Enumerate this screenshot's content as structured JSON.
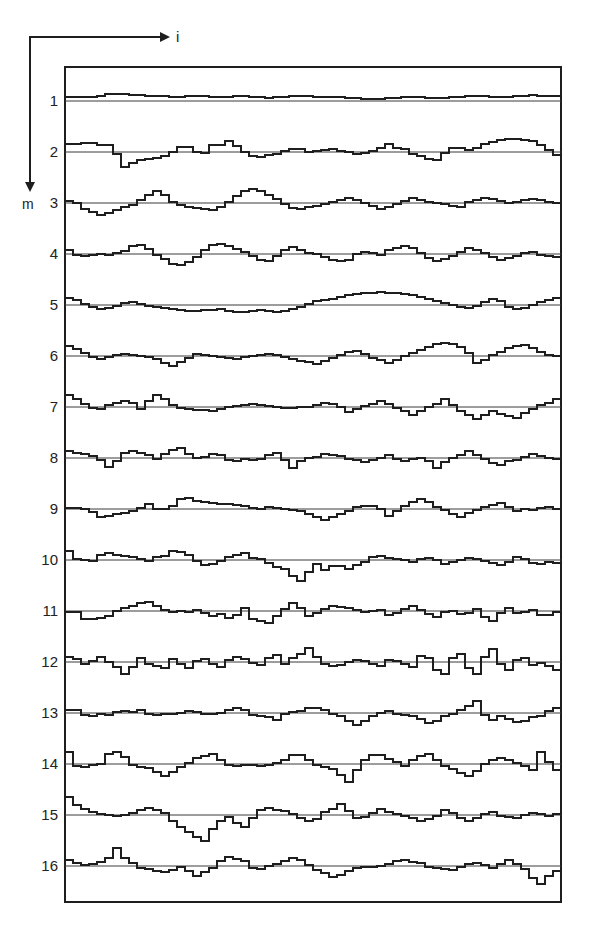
{
  "figure": {
    "x_axis_label": "i",
    "y_axis_label": "m",
    "frame": {
      "x": 65,
      "y": 67,
      "width": 496,
      "height": 835
    },
    "ink_color": "#1e1e1e",
    "baseline_color": "#3a3a3a"
  },
  "chart_data": {
    "type": "line",
    "title": "",
    "xlabel": "i",
    "ylabel": "m",
    "grid": false,
    "legend": "none",
    "step_count": 62,
    "row_labels": [
      "1",
      "2",
      "3",
      "4",
      "5",
      "6",
      "7",
      "8",
      "9",
      "10",
      "11",
      "12",
      "13",
      "14",
      "15",
      "16"
    ],
    "baselines_px": [
      101,
      152,
      203,
      254,
      305,
      356,
      407,
      458,
      509,
      560,
      611,
      662,
      713,
      764,
      815,
      866
    ],
    "series": [
      {
        "name": "1",
        "values": [
          4,
          4,
          4,
          4,
          5,
          7,
          7,
          7,
          6,
          6,
          5,
          5,
          5,
          4,
          4,
          5,
          5,
          5,
          4,
          4,
          4,
          5,
          5,
          4,
          4,
          3,
          4,
          4,
          5,
          5,
          5,
          4,
          4,
          4,
          4,
          3,
          3,
          2,
          2,
          2,
          3,
          3,
          4,
          4,
          4,
          3,
          3,
          3,
          4,
          4,
          5,
          5,
          5,
          4,
          4,
          4,
          5,
          5,
          6,
          5,
          5,
          5
        ]
      },
      {
        "name": "2",
        "values": [
          8,
          8,
          9,
          9,
          7,
          7,
          -2,
          -15,
          -11,
          -8,
          -7,
          -6,
          -4,
          0,
          5,
          5,
          0,
          -1,
          7,
          7,
          11,
          6,
          0,
          -4,
          -5,
          -3,
          -2,
          1,
          3,
          3,
          0,
          1,
          2,
          3,
          1,
          0,
          -2,
          -1,
          1,
          4,
          8,
          4,
          3,
          -2,
          -4,
          -7,
          -8,
          -1,
          4,
          4,
          2,
          4,
          8,
          10,
          12,
          13,
          13,
          12,
          11,
          7,
          2,
          -3
        ]
      },
      {
        "name": "3",
        "values": [
          2,
          0,
          -6,
          -9,
          -12,
          -10,
          -7,
          -4,
          -2,
          3,
          8,
          12,
          8,
          1,
          -2,
          -4,
          -5,
          -6,
          -7,
          -4,
          1,
          7,
          12,
          14,
          12,
          8,
          4,
          -1,
          -5,
          -6,
          -4,
          -3,
          -1,
          1,
          3,
          5,
          3,
          0,
          -3,
          -6,
          -4,
          -1,
          2,
          5,
          3,
          1,
          0,
          -1,
          -3,
          -4,
          1,
          3,
          5,
          4,
          2,
          0,
          1,
          3,
          4,
          3,
          1,
          0
        ]
      },
      {
        "name": "4",
        "values": [
          4,
          -1,
          -2,
          -1,
          0,
          -1,
          1,
          3,
          8,
          9,
          5,
          -1,
          -5,
          -10,
          -11,
          -8,
          -3,
          4,
          9,
          10,
          8,
          5,
          2,
          -2,
          -6,
          -7,
          -2,
          4,
          7,
          4,
          1,
          0,
          -3,
          -6,
          -7,
          -6,
          0,
          2,
          1,
          -1,
          4,
          6,
          8,
          6,
          1,
          -4,
          -7,
          -5,
          -2,
          2,
          6,
          4,
          1,
          -3,
          -6,
          -4,
          -2,
          1,
          2,
          -1,
          -2,
          -3
        ]
      },
      {
        "name": "5",
        "values": [
          7,
          5,
          1,
          -2,
          -4,
          -3,
          -1,
          2,
          3,
          1,
          -1,
          -2,
          -3,
          -4,
          -5,
          -6,
          -6,
          -5,
          -5,
          -4,
          -6,
          -7,
          -7,
          -6,
          -5,
          -6,
          -7,
          -6,
          -4,
          -2,
          1,
          4,
          5,
          6,
          8,
          10,
          11,
          12,
          12,
          13,
          12,
          12,
          11,
          10,
          8,
          6,
          4,
          2,
          0,
          -2,
          -3,
          -1,
          3,
          6,
          4,
          -2,
          -4,
          -3,
          0,
          3,
          5,
          7
        ]
      },
      {
        "name": "6",
        "values": [
          10,
          7,
          3,
          -1,
          -3,
          -1,
          1,
          2,
          1,
          0,
          -1,
          -3,
          -7,
          -10,
          -6,
          -2,
          2,
          1,
          0,
          -1,
          -2,
          -3,
          -1,
          0,
          1,
          2,
          1,
          -1,
          -3,
          -5,
          -6,
          -8,
          -5,
          -2,
          1,
          4,
          5,
          2,
          -2,
          -4,
          -7,
          -4,
          0,
          3,
          6,
          9,
          12,
          13,
          12,
          9,
          3,
          -7,
          -4,
          1,
          4,
          8,
          10,
          11,
          8,
          4,
          1,
          0
        ]
      },
      {
        "name": "7",
        "values": [
          12,
          8,
          3,
          -1,
          -2,
          2,
          4,
          6,
          4,
          -2,
          6,
          12,
          8,
          2,
          -1,
          -2,
          -3,
          -3,
          -4,
          -2,
          0,
          1,
          2,
          3,
          2,
          1,
          0,
          -1,
          -1,
          0,
          0,
          2,
          4,
          3,
          0,
          -5,
          -2,
          1,
          3,
          6,
          3,
          -1,
          -4,
          -8,
          -4,
          0,
          3,
          8,
          2,
          -4,
          -8,
          -12,
          -8,
          -4,
          -7,
          -9,
          -11,
          -6,
          -2,
          2,
          4,
          8
        ]
      },
      {
        "name": "8",
        "values": [
          7,
          5,
          4,
          2,
          -2,
          -9,
          -3,
          5,
          7,
          5,
          3,
          -1,
          4,
          8,
          10,
          4,
          0,
          1,
          4,
          3,
          -2,
          -3,
          -1,
          -2,
          -1,
          3,
          5,
          -2,
          -10,
          -3,
          0,
          1,
          4,
          3,
          2,
          -1,
          -2,
          -4,
          -2,
          0,
          3,
          -1,
          -3,
          -1,
          0,
          -3,
          -10,
          -4,
          0,
          3,
          7,
          3,
          -1,
          -5,
          -7,
          -3,
          -2,
          1,
          4,
          2,
          0,
          -1
        ]
      },
      {
        "name": "9",
        "values": [
          1,
          1,
          0,
          -3,
          -8,
          -7,
          -5,
          -4,
          -2,
          1,
          5,
          0,
          0,
          3,
          10,
          11,
          8,
          7,
          6,
          5,
          5,
          4,
          3,
          1,
          0,
          2,
          1,
          0,
          -1,
          -2,
          -5,
          -8,
          -11,
          -8,
          -5,
          -2,
          2,
          3,
          3,
          0,
          -7,
          -2,
          3,
          7,
          10,
          7,
          2,
          -1,
          -5,
          -8,
          -4,
          -1,
          2,
          4,
          6,
          2,
          -2,
          0,
          -1,
          1,
          2,
          0
        ]
      },
      {
        "name": "10",
        "values": [
          9,
          1,
          0,
          -1,
          5,
          7,
          5,
          4,
          3,
          1,
          -1,
          3,
          4,
          9,
          8,
          5,
          -1,
          -5,
          -4,
          -1,
          3,
          5,
          7,
          2,
          1,
          -3,
          -7,
          -9,
          -16,
          -21,
          -12,
          -4,
          -10,
          -6,
          -6,
          -9,
          -5,
          -2,
          3,
          4,
          2,
          1,
          0,
          -2,
          1,
          2,
          0,
          -4,
          -2,
          0,
          2,
          1,
          -1,
          -3,
          -5,
          -2,
          3,
          1,
          -3,
          -4,
          -2,
          -3
        ]
      },
      {
        "name": "11",
        "values": [
          -1,
          -1,
          -8,
          -8,
          -7,
          -5,
          0,
          3,
          5,
          8,
          9,
          5,
          1,
          -1,
          0,
          -1,
          1,
          -2,
          -5,
          -3,
          -7,
          -4,
          3,
          -8,
          -10,
          -12,
          -5,
          2,
          8,
          3,
          -5,
          -2,
          2,
          5,
          4,
          3,
          1,
          -1,
          0,
          1,
          -4,
          -2,
          2,
          5,
          1,
          -3,
          -6,
          -1,
          0,
          -3,
          -2,
          2,
          -6,
          -10,
          -2,
          3,
          -2,
          -1,
          1,
          -4,
          -4,
          -1
        ]
      },
      {
        "name": "12",
        "values": [
          5,
          3,
          -2,
          1,
          5,
          0,
          -5,
          -12,
          -5,
          4,
          -2,
          -4,
          -6,
          3,
          -2,
          -6,
          1,
          3,
          -2,
          -5,
          2,
          5,
          3,
          -1,
          -3,
          4,
          7,
          -2,
          4,
          8,
          14,
          5,
          -2,
          -4,
          -3,
          0,
          2,
          1,
          -2,
          -4,
          2,
          1,
          -2,
          -5,
          6,
          4,
          -8,
          -12,
          4,
          8,
          -6,
          -12,
          5,
          13,
          -2,
          -8,
          2,
          4,
          -3,
          -1,
          -4,
          -8
        ]
      },
      {
        "name": "13",
        "values": [
          3,
          3,
          -2,
          -3,
          -1,
          -2,
          1,
          2,
          1,
          3,
          -1,
          -2,
          -1,
          -1,
          0,
          2,
          1,
          -1,
          -1,
          0,
          3,
          5,
          3,
          -2,
          -3,
          -4,
          -7,
          -1,
          1,
          2,
          5,
          5,
          3,
          -1,
          -3,
          -8,
          -12,
          -8,
          -3,
          0,
          2,
          -1,
          -2,
          -3,
          -6,
          -10,
          -8,
          -3,
          -1,
          3,
          7,
          12,
          -2,
          -7,
          -3,
          -6,
          -9,
          -8,
          -4,
          -3,
          2,
          5
        ]
      },
      {
        "name": "14",
        "values": [
          12,
          -2,
          -3,
          -1,
          0,
          10,
          12,
          7,
          -1,
          -3,
          -4,
          -8,
          -12,
          -8,
          -3,
          1,
          6,
          8,
          10,
          4,
          -1,
          -2,
          -1,
          -1,
          -2,
          -1,
          1,
          4,
          9,
          9,
          4,
          -1,
          -3,
          -5,
          -11,
          -18,
          -6,
          4,
          9,
          9,
          5,
          2,
          -2,
          4,
          8,
          10,
          4,
          -2,
          -5,
          -9,
          -12,
          -7,
          0,
          4,
          6,
          4,
          1,
          -2,
          -6,
          12,
          2,
          -6
        ]
      },
      {
        "name": "15",
        "values": [
          18,
          10,
          6,
          3,
          1,
          0,
          -1,
          0,
          2,
          5,
          7,
          5,
          2,
          -6,
          -12,
          -17,
          -22,
          -26,
          -14,
          -6,
          -2,
          -8,
          -12,
          -3,
          5,
          7,
          5,
          4,
          1,
          -3,
          -6,
          -4,
          3,
          6,
          11,
          4,
          -3,
          -2,
          2,
          6,
          3,
          1,
          -1,
          -3,
          -6,
          -4,
          -1,
          5,
          2,
          -3,
          -6,
          -3,
          1,
          3,
          -1,
          -2,
          -3,
          0,
          2,
          1,
          -1,
          1
        ]
      },
      {
        "name": "16",
        "values": [
          6,
          3,
          1,
          2,
          4,
          8,
          18,
          8,
          3,
          -2,
          -3,
          -5,
          -6,
          -4,
          -1,
          -5,
          -10,
          -6,
          -2,
          5,
          9,
          7,
          5,
          -2,
          -3,
          0,
          2,
          5,
          8,
          6,
          1,
          -4,
          -7,
          -11,
          -9,
          -5,
          -2,
          -1,
          -1,
          0,
          2,
          5,
          6,
          4,
          3,
          -1,
          -2,
          -3,
          -4,
          -1,
          2,
          3,
          1,
          -2,
          2,
          6,
          2,
          -3,
          -12,
          -18,
          -10,
          -5
        ]
      }
    ]
  }
}
